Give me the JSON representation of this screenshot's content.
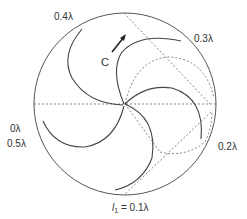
{
  "diagram": {
    "type": "smith-chart-spiral",
    "center": {
      "x": 125,
      "y": 104
    },
    "radius": 91,
    "colors": {
      "stroke": "#555555",
      "dashed": "#666666",
      "text": "#333333",
      "background": "#ffffff"
    }
  },
  "labels": {
    "top_left": "0.4λ",
    "top_right": "0.3λ",
    "left_top": "0λ",
    "left_bottom": "0.5λ",
    "right": "0.2λ",
    "bottom_prefix": "l",
    "bottom_sub": "1",
    "bottom_suffix": " = 0.1λ",
    "point": "C"
  }
}
